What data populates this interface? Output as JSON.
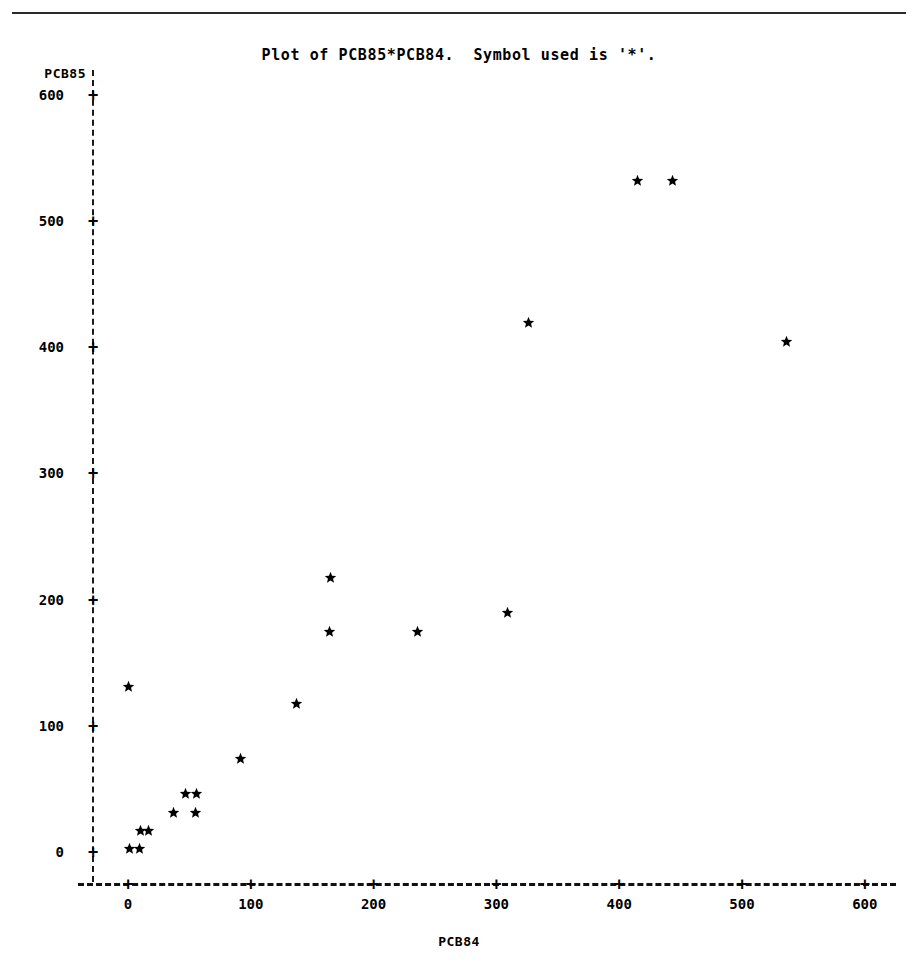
{
  "page": {
    "background_color": "#ffffff",
    "foreground_color": "#000000",
    "top_rule": "horizontal-rule"
  },
  "title": "Plot of PCB85*PCB84.  Symbol used is '*'.",
  "axes": {
    "y_variable_label": "PCB85",
    "x_variable_label": "PCB84",
    "y_ticks": [
      "600",
      "500",
      "400",
      "300",
      "200",
      "100",
      "0"
    ],
    "x_ticks": [
      "0",
      "100",
      "200",
      "300",
      "400",
      "500",
      "600"
    ],
    "tick_marker": "+",
    "axis_style": "dashed"
  },
  "chart_data": {
    "type": "scatter",
    "title": "Plot of PCB85*PCB84.  Symbol used is '*'.",
    "xlabel": "PCB84",
    "ylabel": "PCB85",
    "symbol": "*",
    "xlim": [
      -27,
      627
    ],
    "ylim": [
      -27,
      627
    ],
    "xticks": [
      0,
      100,
      200,
      300,
      400,
      500,
      600
    ],
    "yticks": [
      0,
      100,
      200,
      300,
      400,
      500,
      600
    ],
    "grid": false,
    "legend": null,
    "points": [
      {
        "x": 1,
        "y": 2
      },
      {
        "x": 9,
        "y": 2
      },
      {
        "x": 10,
        "y": 17
      },
      {
        "x": 17,
        "y": 17
      },
      {
        "x": 37,
        "y": 31
      },
      {
        "x": 55,
        "y": 31
      },
      {
        "x": 47,
        "y": 46
      },
      {
        "x": 56,
        "y": 46
      },
      {
        "x": 0,
        "y": 131
      },
      {
        "x": 92,
        "y": 74
      },
      {
        "x": 137,
        "y": 117
      },
      {
        "x": 164,
        "y": 174
      },
      {
        "x": 165,
        "y": 217
      },
      {
        "x": 236,
        "y": 174
      },
      {
        "x": 309,
        "y": 189
      },
      {
        "x": 326,
        "y": 419
      },
      {
        "x": 415,
        "y": 532
      },
      {
        "x": 443,
        "y": 532
      },
      {
        "x": 536,
        "y": 404
      }
    ]
  }
}
